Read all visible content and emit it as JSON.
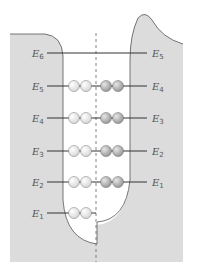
{
  "diagram": {
    "title": "",
    "colors": {
      "barrier": "#dcdcdc",
      "well": "#ffffff",
      "line": "#333333",
      "ball_left": "#d8d8d8",
      "ball_right": "#9a9a9a"
    },
    "levels": [
      {
        "left_label": "E",
        "left_sub": "6",
        "right_label": "E",
        "right_sub": "5",
        "balls_left": 0,
        "balls_right": 0
      },
      {
        "left_label": "E",
        "left_sub": "5",
        "right_label": "E",
        "right_sub": "4",
        "balls_left": 2,
        "balls_right": 2
      },
      {
        "left_label": "E",
        "left_sub": "4",
        "right_label": "E",
        "right_sub": "3",
        "balls_left": 2,
        "balls_right": 2
      },
      {
        "left_label": "E",
        "left_sub": "3",
        "right_label": "E",
        "right_sub": "2",
        "balls_left": 2,
        "balls_right": 2
      },
      {
        "left_label": "E",
        "left_sub": "2",
        "right_label": "E",
        "right_sub": "1",
        "balls_left": 2,
        "balls_right": 2
      },
      {
        "left_label": "E",
        "left_sub": "1",
        "right_label": "",
        "right_sub": "",
        "balls_left": 2,
        "balls_right": 0
      }
    ]
  }
}
